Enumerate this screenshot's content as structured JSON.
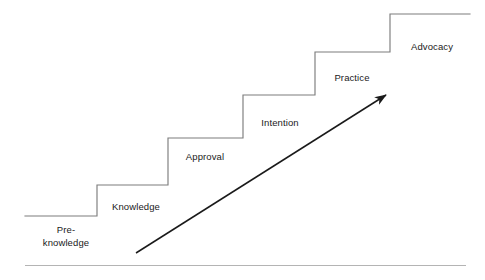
{
  "diagram": {
    "type": "staircase-with-arrow",
    "background_color": "#ffffff",
    "line_color": "#7d7d7d",
    "arrow_color": "#1a1a1a",
    "text_color": "#1a1a1a",
    "baseline_color": "#b0b0b0",
    "steps": [
      {
        "id": "step-pre-knowledge",
        "label": "Pre-\nknowledge",
        "label_lines": [
          "Pre-",
          "knowledge"
        ],
        "order": 1,
        "label_x": 66,
        "label_y": 236,
        "tread_y": 216,
        "tread_x1": 25,
        "tread_x2": 97
      },
      {
        "id": "step-knowledge",
        "label": "Knowledge",
        "label_lines": [
          "Knowledge"
        ],
        "order": 2,
        "label_x": 136,
        "label_y": 207,
        "tread_y": 185,
        "tread_x1": 97,
        "tread_x2": 168
      },
      {
        "id": "step-approval",
        "label": "Approval",
        "label_lines": [
          "Approval"
        ],
        "order": 3,
        "label_x": 205,
        "label_y": 157,
        "tread_y": 138,
        "tread_x1": 168,
        "tread_x2": 243
      },
      {
        "id": "step-intention",
        "label": "Intention",
        "label_lines": [
          "Intention"
        ],
        "order": 4,
        "label_x": 280,
        "label_y": 123,
        "tread_y": 95,
        "tread_x1": 243,
        "tread_x2": 315
      },
      {
        "id": "step-practice",
        "label": "Practice",
        "label_lines": [
          "Practice"
        ],
        "order": 5,
        "label_x": 352,
        "label_y": 78,
        "tread_y": 52,
        "tread_x1": 315,
        "tread_x2": 390
      },
      {
        "id": "step-advocacy",
        "label": "Advocacy",
        "label_lines": [
          "Advocacy"
        ],
        "order": 6,
        "label_x": 432,
        "label_y": 47,
        "tread_y": 14,
        "tread_x1": 390,
        "tread_x2": 470
      }
    ],
    "arrow": {
      "id": "progress-arrow",
      "from_x": 136,
      "from_y": 253,
      "to_x": 390,
      "to_y": 92,
      "direction": "up-right"
    },
    "baseline": {
      "id": "bottom-rule",
      "x1": 25,
      "x2": 466,
      "y": 265
    }
  }
}
